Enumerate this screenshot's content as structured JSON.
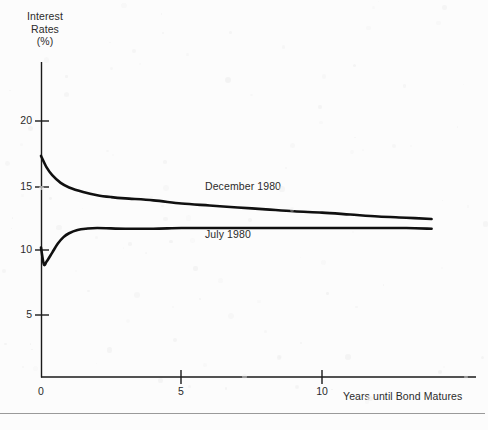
{
  "chart_data": {
    "type": "line",
    "title": "",
    "subtitle": "",
    "xlabel": "Years until Bond Matures",
    "ylabel": "Interest Rates (%)",
    "ylabel_lines": [
      "Interest",
      "Rates",
      "(%)"
    ],
    "xlim": [
      0,
      13.9
    ],
    "ylim": [
      0,
      21.5
    ],
    "xticks": [
      0,
      5,
      10
    ],
    "xticklabels": [
      "0",
      "5",
      "10"
    ],
    "yticks": [
      5,
      10,
      15,
      20
    ],
    "yticklabels": [
      "5",
      "10",
      "15",
      "20"
    ],
    "grid": false,
    "legend": "inline-annotations",
    "line_color": "#101010",
    "background_color": "#fcfcfc",
    "series": [
      {
        "name": "December 1980",
        "label": "December 1980",
        "shape": "inverted",
        "x": [
          0,
          0.2,
          0.4,
          0.7,
          1.0,
          1.5,
          2.0,
          2.5,
          3.0,
          4.0,
          5.0,
          6.0,
          7.0,
          8.0,
          9.0,
          10.0,
          11.0,
          12.0,
          13.0,
          13.9
        ],
        "values": [
          17.3,
          16.4,
          15.8,
          15.2,
          14.85,
          14.5,
          14.25,
          14.1,
          14.0,
          13.85,
          13.6,
          13.45,
          13.3,
          13.15,
          13.0,
          12.9,
          12.75,
          12.6,
          12.5,
          12.4
        ]
      },
      {
        "name": "July 1980",
        "label": "July 1980",
        "shape": "normal",
        "x": [
          0,
          0.1,
          0.2,
          0.4,
          0.6,
          0.8,
          1.0,
          1.3,
          1.6,
          2.0,
          3.0,
          4.0,
          5.0,
          6.0,
          7.0,
          8.0,
          9.0,
          10.0,
          11.0,
          12.0,
          13.0,
          13.9
        ],
        "values": [
          10.2,
          8.9,
          9.1,
          9.8,
          10.5,
          11.0,
          11.3,
          11.55,
          11.65,
          11.7,
          11.65,
          11.65,
          11.7,
          11.7,
          11.7,
          11.7,
          11.7,
          11.7,
          11.7,
          11.7,
          11.7,
          11.65
        ]
      }
    ],
    "annotations": [
      {
        "text": "December 1980",
        "series": "December 1980",
        "x": 5.8,
        "y": 15.0
      },
      {
        "text": "July 1980",
        "series": "July 1980",
        "x": 5.8,
        "y": 11.2
      }
    ]
  }
}
